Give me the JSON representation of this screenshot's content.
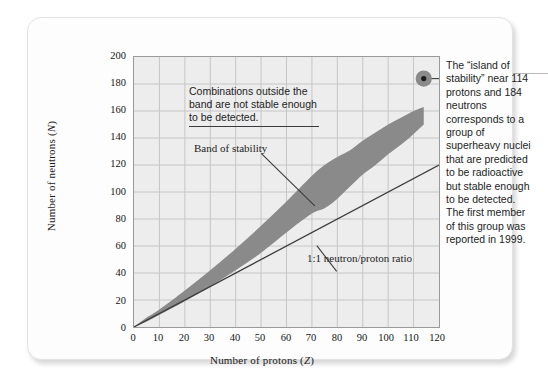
{
  "figure": {
    "background_color": "#fdfdfd",
    "plot_background_color": "#ededed",
    "band_color": "#8a8a8a",
    "grid_color": "#c6c6c6",
    "axis_color": "#9a9a9a",
    "line_color": "#3b3b3b"
  },
  "axes": {
    "y_title_prefix": "Number of neutrons (",
    "y_title_symbol": "N",
    "y_title_suffix": ")",
    "x_title_prefix": "Number of protons (",
    "x_title_symbol": "Z",
    "x_title_suffix": ")",
    "y_ticks": [
      "0",
      "20",
      "40",
      "60",
      "80",
      "100",
      "120",
      "140",
      "160",
      "180",
      "200"
    ],
    "x_ticks": [
      "0",
      "10",
      "20",
      "30",
      "40",
      "50",
      "60",
      "70",
      "80",
      "90",
      "100",
      "110",
      "120"
    ]
  },
  "annotations": {
    "outside_band": "Combinations outside the\nband are not stable enough\nto be detected.",
    "band_of_stability": "Band of stability",
    "ratio_line": "1:1 neutron/proton ratio",
    "island_of_stability": "The “island of stability” near 114 protons and 184 neutrons corresponds to a group of superheavy nuclei that are predicted to be radioactive but stable enough to be detected. The first member of this group was reported in 1999."
  },
  "chart_data": {
    "type": "area",
    "title": "",
    "xlabel": "Number of protons (Z)",
    "ylabel": "Number of neutrons (N)",
    "xlim": [
      0,
      120
    ],
    "ylim": [
      0,
      200
    ],
    "x_tick_step": 10,
    "y_tick_step": 20,
    "grid": true,
    "legend": "none",
    "series": [
      {
        "name": "Band of stability (upper boundary N)",
        "x": [
          0,
          5,
          10,
          20,
          30,
          40,
          50,
          60,
          70,
          75,
          80,
          85,
          90,
          95,
          100,
          105,
          110,
          114
        ],
        "values": [
          0,
          7,
          13,
          27,
          42,
          58,
          75,
          93,
          112,
          120,
          126,
          131,
          138,
          144,
          150,
          155,
          160,
          163
        ]
      },
      {
        "name": "Band of stability (lower boundary N)",
        "x": [
          0,
          5,
          10,
          20,
          30,
          40,
          50,
          60,
          70,
          75,
          80,
          85,
          90,
          95,
          100,
          105,
          110,
          114
        ],
        "values": [
          0,
          4,
          9,
          19,
          30,
          42,
          55,
          70,
          84,
          88,
          95,
          104,
          113,
          120,
          128,
          135,
          143,
          150
        ]
      },
      {
        "name": "1:1 neutron/proton ratio",
        "x": [
          0,
          120
        ],
        "values": [
          0,
          120
        ]
      }
    ],
    "points": [
      {
        "name": "island of stability",
        "x": 114,
        "y": 184,
        "label": "island of stability"
      }
    ]
  }
}
